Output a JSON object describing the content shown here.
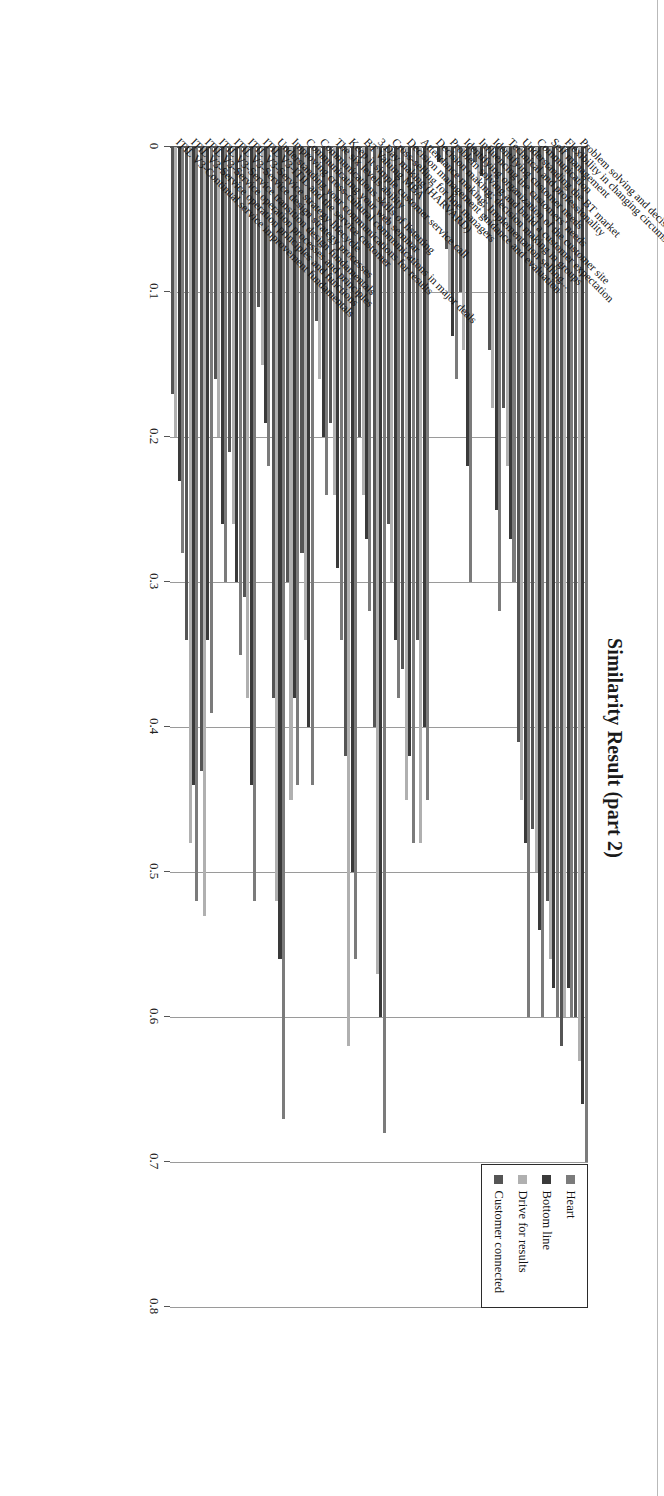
{
  "chart_data": {
    "type": "bar",
    "orientation": "horizontal",
    "title": "Similarity Result (part 2)",
    "xlabel": "",
    "ylabel": "",
    "xlim": [
      0,
      0.8
    ],
    "grid": true,
    "tick_labels": [
      "0",
      "0.1",
      "0.2",
      "0.3",
      "0.4",
      "0.5",
      "0.6",
      "0.7",
      "0.8"
    ],
    "tick_values": [
      0,
      0.1,
      0.2,
      0.3,
      0.4,
      0.5,
      0.6,
      0.7,
      0.8
    ],
    "legend_position": "top-right",
    "categories": [
      "Problem solving and decision making",
      "Flexibility in changing circumstances",
      "Self management",
      "Communication",
      "Understanding the BT market",
      "Technical and professionality",
      "Identifying customer needs",
      "Influencing the customers' needs",
      "Identifying organization of the customer site",
      "Problem solving and build a customer expectation",
      "Decision making; decision making in groups",
      "Attendance making; Implementation selling...",
      "Decision management guidance and evaluation",
      "Cross-selling for line managers",
      "3 Day making (HARVARD)",
      "BT Valuing MBA",
      "Keep it simple customer service call",
      "The six levels ability",
      "Communications skills of listening",
      "Communicating your web seminar",
      "Improving cross-cultural communications in major deals",
      "Understanding your communications for results",
      "ITIL V3-ITIL and the service customer",
      "ITIL V3-Service strategy lifecycle",
      "ITIL V3-Service design strategy processes",
      "ITIL V3-Service transition design fundamentals",
      "ITIL V3-Service operation processes and principles",
      "ITIL V3-Service operation principles and functions",
      "ITIL V3-Continual service improvement fundamentals"
    ],
    "series": [
      {
        "name": "Heart",
        "color": "#7b7b7b",
        "values": [
          0.7,
          0.6,
          0.6,
          0.6,
          0.6,
          0.3,
          0.32,
          0.05,
          0.3,
          0.16,
          0.01,
          0.45,
          0.48,
          0.38,
          0.68,
          0.32,
          0.56,
          0.34,
          0.24,
          0.44,
          0.44,
          0.67,
          0.22,
          0.52,
          0.35,
          0.3,
          0.39,
          0.52,
          0.28
        ]
      },
      {
        "name": "Bottom line",
        "color": "#3a3a3a",
        "values": [
          0.66,
          0.58,
          0.58,
          0.54,
          0.48,
          0.27,
          0.25,
          0.02,
          0.22,
          0.13,
          0.01,
          0.4,
          0.42,
          0.34,
          0.6,
          0.27,
          0.5,
          0.29,
          0.2,
          0.4,
          0.38,
          0.56,
          0.19,
          0.44,
          0.3,
          0.26,
          0.34,
          0.44,
          0.23
        ]
      },
      {
        "name": "Drive for results",
        "color": "#b0b0b0",
        "values": [
          0.63,
          0.6,
          0.56,
          0.5,
          0.45,
          0.22,
          0.18,
          0.04,
          0.14,
          0.1,
          0.0,
          0.48,
          0.45,
          0.3,
          0.57,
          0.24,
          0.62,
          0.24,
          0.16,
          0.34,
          0.45,
          0.52,
          0.15,
          0.38,
          0.26,
          0.2,
          0.53,
          0.48,
          0.2
        ]
      },
      {
        "name": "Customer connected",
        "color": "#555555",
        "values": [
          0.6,
          0.62,
          0.52,
          0.47,
          0.41,
          0.18,
          0.14,
          0.01,
          0.1,
          0.07,
          0.0,
          0.34,
          0.36,
          0.26,
          0.4,
          0.2,
          0.42,
          0.19,
          0.12,
          0.28,
          0.3,
          0.38,
          0.11,
          0.31,
          0.21,
          0.16,
          0.43,
          0.34,
          0.17
        ]
      }
    ]
  },
  "legend": {
    "items": [
      {
        "label": "Heart"
      },
      {
        "label": "Bottom line"
      },
      {
        "label": "Drive for results"
      },
      {
        "label": "Customer connected"
      }
    ]
  }
}
